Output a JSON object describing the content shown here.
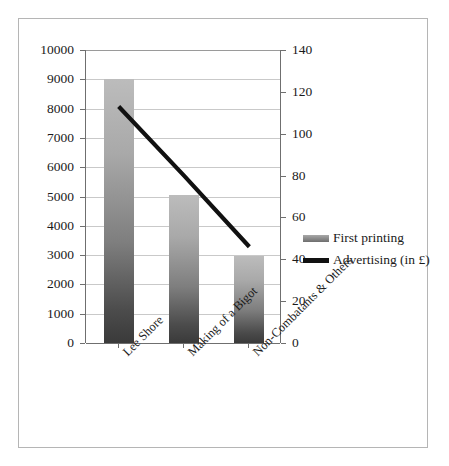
{
  "chart_data": {
    "type": "bar",
    "title": "",
    "subtitle": "",
    "xlabel": "",
    "ylabel": "",
    "grid": true,
    "legend_position": "right",
    "categories": [
      "Lee Shore",
      "Making of a Bigot",
      "Non-Combatants & Others"
    ],
    "series": [
      {
        "name": "First printing",
        "type": "bar",
        "axis": "left",
        "color": "#8a8a8a",
        "values": [
          9000,
          5050,
          2960
        ]
      },
      {
        "name": "Advertising (in £)",
        "type": "line",
        "axis": "right",
        "color": "#111111",
        "values": [
          113,
          80,
          46
        ]
      }
    ],
    "axes": {
      "left": {
        "min": 0,
        "max": 10000,
        "step": 1000,
        "ticks": [
          "0",
          "1000",
          "2000",
          "3000",
          "4000",
          "5000",
          "6000",
          "7000",
          "8000",
          "9000",
          "10000"
        ]
      },
      "right": {
        "min": 0,
        "max": 140,
        "step": 20,
        "ticks": [
          "0",
          "20",
          "40",
          "60",
          "80",
          "100",
          "120",
          "140"
        ]
      }
    }
  },
  "legend": {
    "items": [
      {
        "label": "First printing",
        "key": "bar-swatch"
      },
      {
        "label": "Advertising (in £)",
        "key": "line-swatch"
      }
    ]
  }
}
